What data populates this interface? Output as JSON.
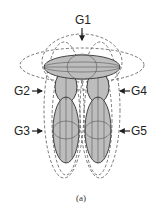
{
  "diagram": {
    "top_label": "G1",
    "left_labels": [
      "G2",
      "G3"
    ],
    "right_labels": [
      "G4",
      "G5"
    ],
    "caption": "(a)"
  }
}
